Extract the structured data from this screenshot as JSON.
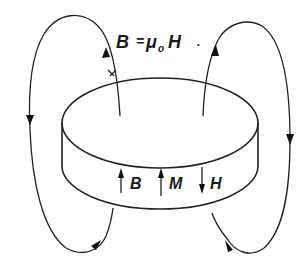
{
  "diagram": {
    "equation": {
      "lhs": "B",
      "equals": "=",
      "mu": "μ",
      "subscript": "o",
      "rhs": "H",
      "period": "."
    },
    "labels": {
      "b": "B",
      "m": "M",
      "h": "H"
    },
    "arrows_inside": [
      {
        "label": "B",
        "direction": "up"
      },
      {
        "label": "M",
        "direction": "up"
      },
      {
        "label": "H",
        "direction": "down"
      }
    ],
    "field_loops": [
      {
        "side": "left",
        "direction": "up-through-disc-top, down-outside"
      },
      {
        "side": "right",
        "direction": "up-through-disc-top, down-outside"
      }
    ],
    "colors": {
      "ink": "#222222",
      "background": "#ffffff"
    }
  }
}
